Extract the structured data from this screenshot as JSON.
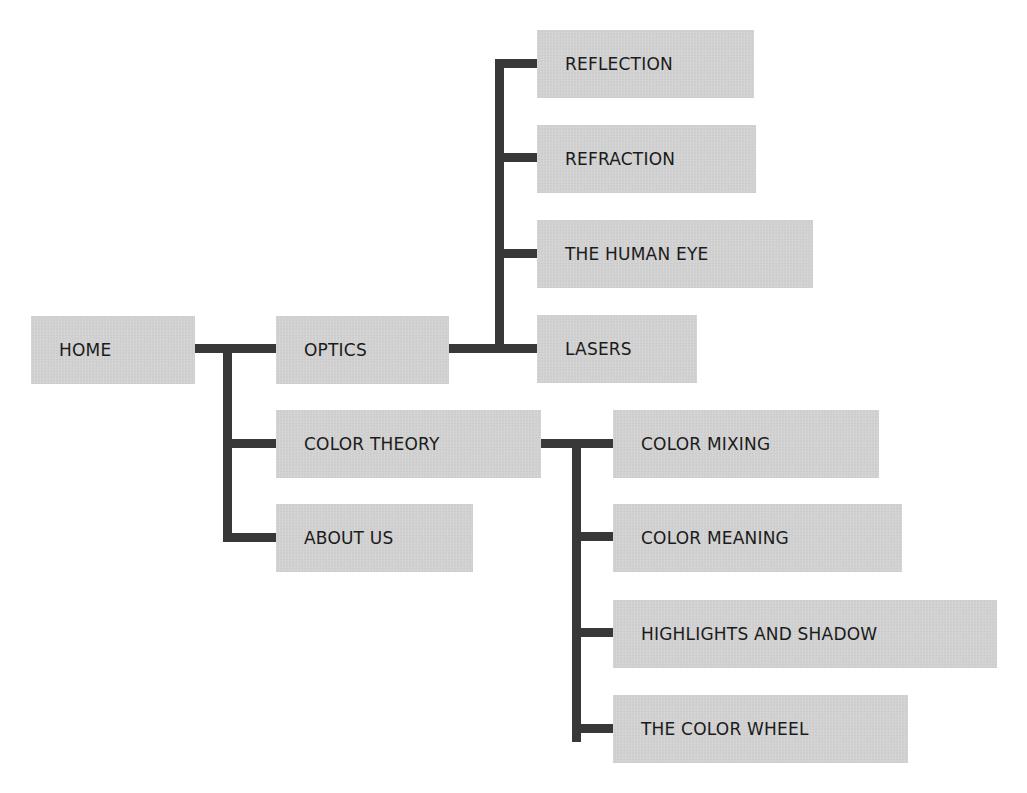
{
  "diagram": {
    "type": "sitemap-tree",
    "colors": {
      "node_fill": "#d3d3d3",
      "node_text": "#1b1b1b",
      "connector": "#383838",
      "background": "#ffffff"
    },
    "root": {
      "label": "HOME",
      "children": [
        {
          "label": "OPTICS",
          "children": [
            {
              "label": "REFLECTION"
            },
            {
              "label": "REFRACTION"
            },
            {
              "label": "THE HUMAN EYE"
            },
            {
              "label": "LASERS"
            }
          ]
        },
        {
          "label": "COLOR THEORY",
          "children": [
            {
              "label": "COLOR MIXING"
            },
            {
              "label": "COLOR MEANING"
            },
            {
              "label": "HIGHLIGHTS AND SHADOW"
            },
            {
              "label": "THE COLOR WHEEL"
            }
          ]
        },
        {
          "label": "ABOUT US"
        }
      ]
    }
  }
}
